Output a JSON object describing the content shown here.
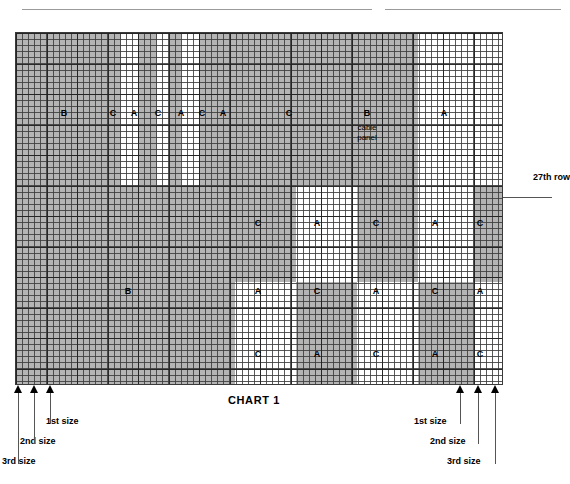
{
  "title": "CHART 1",
  "annotations": {
    "row_marker": "27th row",
    "cable_panel": "cable\npanel",
    "cable_panel_line1": "cable",
    "cable_panel_line2": "panel"
  },
  "colors": {
    "shaded": "#b4b4b4",
    "plain": "#ffffff",
    "grid_line": "#3c3c3c",
    "text": "#000000"
  },
  "grid": {
    "cols": 80,
    "rows": 58,
    "cell_px": 6.1,
    "origin_x": 15,
    "origin_y": 32,
    "width": 488,
    "height": 353
  },
  "bands": [
    {
      "name": "top-band",
      "y": 0,
      "h": 152
    },
    {
      "name": "middle-band",
      "y": 152,
      "h": 97
    },
    {
      "name": "third-band",
      "y": 249,
      "h": 62
    },
    {
      "name": "bottom-band",
      "y": 311,
      "h": 42
    }
  ],
  "blocks": [
    {
      "band": 0,
      "x": 0,
      "w": 105,
      "fill": "shaded"
    },
    {
      "band": 0,
      "x": 105,
      "w": 18,
      "fill": "plain"
    },
    {
      "band": 0,
      "x": 123,
      "w": 18,
      "fill": "shaded"
    },
    {
      "band": 0,
      "x": 141,
      "w": 12,
      "fill": "plain"
    },
    {
      "band": 0,
      "x": 153,
      "w": 12,
      "fill": "shaded"
    },
    {
      "band": 0,
      "x": 165,
      "w": 18,
      "fill": "plain"
    },
    {
      "band": 0,
      "x": 183,
      "w": 18,
      "fill": "shaded"
    },
    {
      "band": 0,
      "x": 201,
      "w": 146,
      "fill": "shaded"
    },
    {
      "band": 0,
      "x": 347,
      "w": 55,
      "fill": "shaded"
    },
    {
      "band": 0,
      "x": 402,
      "w": 86,
      "fill": "plain"
    },
    {
      "band": 1,
      "x": 0,
      "w": 280,
      "fill": "shaded"
    },
    {
      "band": 1,
      "x": 280,
      "w": 61,
      "fill": "plain"
    },
    {
      "band": 1,
      "x": 341,
      "w": 61,
      "fill": "shaded"
    },
    {
      "band": 1,
      "x": 402,
      "w": 55,
      "fill": "plain"
    },
    {
      "band": 1,
      "x": 457,
      "w": 31,
      "fill": "shaded"
    },
    {
      "band": 2,
      "x": 0,
      "w": 219,
      "fill": "shaded"
    },
    {
      "band": 2,
      "x": 219,
      "w": 61,
      "fill": "plain"
    },
    {
      "band": 2,
      "x": 280,
      "w": 61,
      "fill": "shaded"
    },
    {
      "band": 2,
      "x": 341,
      "w": 61,
      "fill": "plain"
    },
    {
      "band": 2,
      "x": 402,
      "w": 55,
      "fill": "shaded"
    },
    {
      "band": 2,
      "x": 457,
      "w": 31,
      "fill": "plain"
    },
    {
      "band": 3,
      "x": 0,
      "w": 219,
      "fill": "shaded"
    },
    {
      "band": 3,
      "x": 219,
      "w": 61,
      "fill": "plain"
    },
    {
      "band": 3,
      "x": 280,
      "w": 61,
      "fill": "shaded"
    },
    {
      "band": 3,
      "x": 341,
      "w": 61,
      "fill": "plain"
    },
    {
      "band": 3,
      "x": 402,
      "w": 55,
      "fill": "shaded"
    },
    {
      "band": 3,
      "x": 457,
      "w": 31,
      "fill": "plain"
    }
  ],
  "letters": [
    {
      "text": "B",
      "x": 63,
      "y": 112
    },
    {
      "text": "C",
      "x": 112,
      "y": 112
    },
    {
      "text": "A",
      "x": 133,
      "y": 112
    },
    {
      "text": "C",
      "x": 157,
      "y": 112
    },
    {
      "text": "A",
      "x": 180,
      "y": 112
    },
    {
      "text": "C",
      "x": 201,
      "y": 112
    },
    {
      "text": "A",
      "x": 222,
      "y": 112
    },
    {
      "text": "C",
      "x": 288,
      "y": 112
    },
    {
      "text": "B",
      "x": 366,
      "y": 112
    },
    {
      "text": "A",
      "x": 443,
      "y": 112
    },
    {
      "text": "C",
      "x": 257,
      "y": 222
    },
    {
      "text": "A",
      "x": 316,
      "y": 222
    },
    {
      "text": "C",
      "x": 375,
      "y": 222
    },
    {
      "text": "A",
      "x": 434,
      "y": 222
    },
    {
      "text": "C",
      "x": 479,
      "y": 222
    },
    {
      "text": "B",
      "x": 127,
      "y": 290
    },
    {
      "text": "A",
      "x": 257,
      "y": 290
    },
    {
      "text": "C",
      "x": 316,
      "y": 290
    },
    {
      "text": "A",
      "x": 375,
      "y": 290
    },
    {
      "text": "C",
      "x": 434,
      "y": 290
    },
    {
      "text": "A",
      "x": 479,
      "y": 290
    },
    {
      "text": "C",
      "x": 257,
      "y": 353
    },
    {
      "text": "A",
      "x": 316,
      "y": 353
    },
    {
      "text": "C",
      "x": 375,
      "y": 353
    },
    {
      "text": "A",
      "x": 434,
      "y": 353
    },
    {
      "text": "C",
      "x": 479,
      "y": 353
    }
  ],
  "cable_note_pos": {
    "x": 366,
    "y": 122
  },
  "arrows_left": [
    {
      "x": 18,
      "label": "3rd size",
      "label_x": 2,
      "label_y": 456,
      "stem_h": 72
    },
    {
      "x": 34,
      "label": "2nd size",
      "label_x": 20,
      "label_y": 436,
      "stem_h": 52
    },
    {
      "x": 50,
      "label": "1st size",
      "label_x": 46,
      "label_y": 416,
      "stem_h": 32
    }
  ],
  "arrows_right": [
    {
      "x": 460,
      "label": "1st size",
      "label_x": 414,
      "label_y": 416,
      "stem_h": 32
    },
    {
      "x": 478,
      "label": "2nd size",
      "label_x": 430,
      "label_y": 436,
      "stem_h": 52
    },
    {
      "x": 495,
      "label": "3rd size",
      "label_x": 447,
      "label_y": 456,
      "stem_h": 72
    }
  ]
}
